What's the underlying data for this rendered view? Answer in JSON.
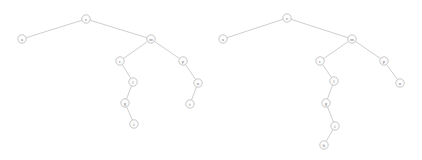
{
  "figure": {
    "background_color": "#ffffff",
    "node_fill_color": "#fdfdfd",
    "node_stroke_color": "#b0b0b0",
    "edge_color": "#b9b9b9",
    "label_color": "#6f6f6f",
    "node_radius": 4.2
  },
  "trees": [
    {
      "id": "tree-left",
      "name": "left-tree",
      "root": "c",
      "nodes": [
        {
          "id": "c",
          "label": "c",
          "x": 86,
          "y": 19
        },
        {
          "id": "a",
          "label": "a",
          "x": 22,
          "y": 39
        },
        {
          "id": "m",
          "label": "m",
          "x": 151,
          "y": 39
        },
        {
          "id": "e",
          "label": "e",
          "x": 120,
          "y": 61
        },
        {
          "id": "p",
          "label": "p",
          "x": 183,
          "y": 61
        },
        {
          "id": "l",
          "label": "l",
          "x": 133,
          "y": 82
        },
        {
          "id": "u",
          "label": "u",
          "x": 198,
          "y": 83
        },
        {
          "id": "g",
          "label": "g",
          "x": 125,
          "y": 103
        },
        {
          "id": "t",
          "label": "t",
          "x": 190,
          "y": 104
        },
        {
          "id": "i",
          "label": "i",
          "x": 134,
          "y": 124
        }
      ],
      "edges": [
        {
          "from": "c",
          "to": "a"
        },
        {
          "from": "c",
          "to": "m"
        },
        {
          "from": "m",
          "to": "e"
        },
        {
          "from": "m",
          "to": "p"
        },
        {
          "from": "e",
          "to": "l"
        },
        {
          "from": "p",
          "to": "u"
        },
        {
          "from": "l",
          "to": "g"
        },
        {
          "from": "u",
          "to": "t"
        },
        {
          "from": "g",
          "to": "i"
        }
      ]
    },
    {
      "id": "tree-right",
      "name": "right-tree",
      "root": "c",
      "nodes": [
        {
          "id": "c",
          "label": "c",
          "x": 287,
          "y": 18
        },
        {
          "id": "a",
          "label": "a",
          "x": 223,
          "y": 39
        },
        {
          "id": "m",
          "label": "m",
          "x": 352,
          "y": 39
        },
        {
          "id": "e",
          "label": "e",
          "x": 320,
          "y": 61
        },
        {
          "id": "p",
          "label": "p",
          "x": 384,
          "y": 61
        },
        {
          "id": "l",
          "label": "l",
          "x": 334,
          "y": 81
        },
        {
          "id": "u",
          "label": "u",
          "x": 400,
          "y": 83
        },
        {
          "id": "g",
          "label": "g",
          "x": 326,
          "y": 103
        },
        {
          "id": "i",
          "label": "i",
          "x": 335,
          "y": 126
        },
        {
          "id": "h",
          "label": "h",
          "x": 324,
          "y": 145
        }
      ],
      "edges": [
        {
          "from": "c",
          "to": "a"
        },
        {
          "from": "c",
          "to": "m"
        },
        {
          "from": "m",
          "to": "e"
        },
        {
          "from": "m",
          "to": "p"
        },
        {
          "from": "e",
          "to": "l"
        },
        {
          "from": "p",
          "to": "u"
        },
        {
          "from": "l",
          "to": "g"
        },
        {
          "from": "g",
          "to": "i"
        },
        {
          "from": "i",
          "to": "h"
        }
      ]
    }
  ]
}
